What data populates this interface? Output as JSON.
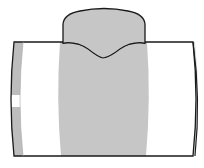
{
  "diagram": {
    "colors": {
      "background": "#ffffff",
      "outline": "#1a1a1a",
      "shade": "#c6c6c6",
      "end_band": "#bdbdbd"
    },
    "parts": [
      {
        "name": "main-pipe-body"
      },
      {
        "name": "branch-outlet"
      },
      {
        "name": "saddle-weld-line"
      },
      {
        "name": "shaded-fitting-zone"
      },
      {
        "name": "left-pipe-end"
      },
      {
        "name": "right-pipe-end"
      }
    ]
  }
}
